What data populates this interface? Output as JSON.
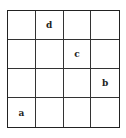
{
  "grid": {
    "rows": 4,
    "cols": 4,
    "cells": [
      [
        "",
        "d",
        "",
        ""
      ],
      [
        "",
        "",
        "c",
        ""
      ],
      [
        "",
        "",
        "",
        "b"
      ],
      [
        "a",
        "",
        "",
        ""
      ]
    ]
  }
}
